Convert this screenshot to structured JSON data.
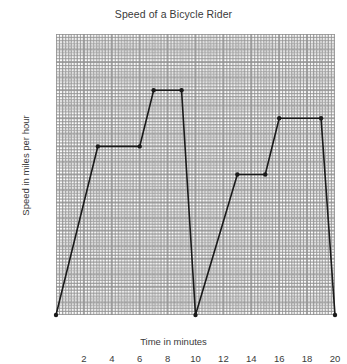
{
  "chart_data": {
    "type": "line",
    "title": "Speed of a Bicycle Rider",
    "xlabel": "Time in minutes",
    "ylabel": "Speed in miles per hour",
    "xlim": [
      0,
      20
    ],
    "ylim": [
      0,
      20
    ],
    "xticks": [
      2,
      4,
      6,
      8,
      10,
      12,
      14,
      16,
      18,
      20
    ],
    "yticks": [
      2,
      4,
      6,
      8,
      10,
      12,
      14,
      16,
      18,
      20
    ],
    "grid": "dotted-minor-and-major",
    "legend": "none",
    "x": [
      0,
      3,
      6,
      7,
      9,
      10,
      13,
      15,
      16,
      19,
      20
    ],
    "values": [
      0,
      12,
      12,
      16,
      16,
      0,
      10,
      10,
      14,
      14,
      0
    ],
    "points": [
      {
        "x": 0,
        "y": 0
      },
      {
        "x": 3,
        "y": 12
      },
      {
        "x": 6,
        "y": 12
      },
      {
        "x": 7,
        "y": 16
      },
      {
        "x": 9,
        "y": 16
      },
      {
        "x": 10,
        "y": 0
      },
      {
        "x": 13,
        "y": 10
      },
      {
        "x": 15,
        "y": 10
      },
      {
        "x": 16,
        "y": 14
      },
      {
        "x": 19,
        "y": 14
      },
      {
        "x": 20,
        "y": 0
      }
    ],
    "line_color": "#1a1a1a",
    "marker_color": "#1a1a1a",
    "marker": "circle",
    "background": "#ffffff",
    "grid_color": "#8c8c8c"
  }
}
